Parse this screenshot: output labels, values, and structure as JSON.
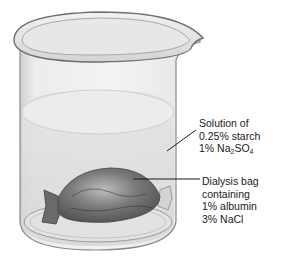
{
  "diagram": {
    "labels": {
      "solution": {
        "line1": "Solution of",
        "line2": "0.25% starch",
        "line3_prefix": "1% Na",
        "line3_sub1": "2",
        "line3_mid": "SO",
        "line3_sub2": "4"
      },
      "bag": {
        "line1": "Dialysis bag",
        "line2": "containing",
        "line3": "1% albumin",
        "line4": "3% NaCl"
      }
    },
    "colors": {
      "glass": "#e6e6e6",
      "glass_edge": "#8a8a8a",
      "solution": "#d9d9d9",
      "bag": "#7a7a7a",
      "leader_line": "#1a1a1a",
      "text": "#1a1a1a"
    }
  }
}
